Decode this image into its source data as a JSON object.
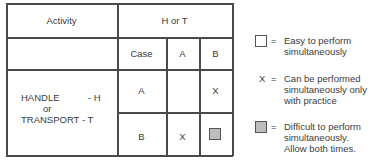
{
  "table": {
    "header": {
      "activity": "Activity",
      "h_or_t": "H or T"
    },
    "subheader": {
      "case": "Case",
      "col_a": "A",
      "col_b": "B"
    },
    "row_label": {
      "line1_left": "HANDLE",
      "line1_right": "- H",
      "line2": "or",
      "line3": "TRANSPORT - T"
    },
    "rows": [
      {
        "case": "A",
        "a": "",
        "b": "X"
      },
      {
        "case": "B",
        "a": "X",
        "b": "gray-square"
      }
    ]
  },
  "legend": {
    "items": [
      {
        "symbol": "white-square",
        "eq": "=",
        "lines": [
          "Easy to perform",
          "simultaneously"
        ]
      },
      {
        "symbol": "X",
        "eq": "=",
        "lines": [
          "Can be performed",
          "simultaneously only",
          "with practice"
        ]
      },
      {
        "symbol": "gray-square",
        "eq": "=",
        "lines": [
          "Difficult to perform",
          "simultaneously.",
          "Allow both times."
        ]
      }
    ]
  },
  "colors": {
    "line": "#4a4a4a",
    "gray_fill": "#bdbdbd",
    "text": "#3c3c3c"
  }
}
